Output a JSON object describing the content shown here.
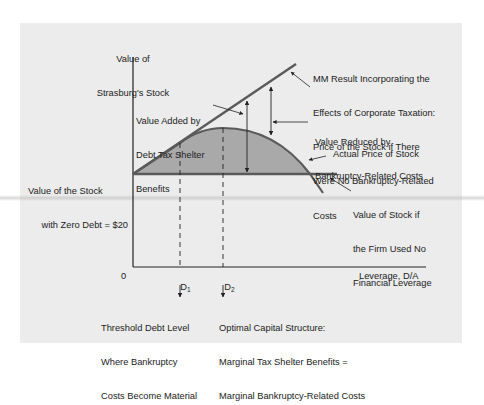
{
  "diagram": {
    "y_axis_label": [
      "Value of",
      "Strasburg's Stock"
    ],
    "x_axis_label": "Leverage, D/A",
    "origin_label": "0",
    "ticks": [
      {
        "main": "D",
        "sub": "1"
      },
      {
        "main": "D",
        "sub": "2"
      }
    ],
    "annotations": {
      "mm_result": [
        "MM Result Incorporating the",
        "Effects of Corporate Taxation:",
        "Price of the Stock if There",
        "Were No Bankruptcy-Related",
        "Costs"
      ],
      "value_added": [
        "Value Added by",
        "Debt Tax Shelter",
        "Benefits"
      ],
      "value_reduced": [
        "Value Reduced by",
        "Bankruptcy-Related Costs"
      ],
      "actual_price": "Actual Price of Stock",
      "zero_debt": [
        "Value of the Stock",
        "with Zero Debt = $20"
      ],
      "no_leverage": [
        "Value of Stock if",
        "the Firm Used No",
        "Financial Leverage"
      ],
      "threshold": [
        "Threshold Debt Level",
        "Where Bankruptcy",
        "Costs Become Material"
      ],
      "optimal": [
        "Optimal Capital Structure:",
        "Marginal Tax Shelter Benefits =",
        "Marginal Bankruptcy-Related Costs"
      ]
    },
    "colors": {
      "panel": "#ececec",
      "line": "#5a5a5a",
      "fill": "#a9a9a9",
      "axis": "#222222",
      "text": "#222222"
    }
  }
}
